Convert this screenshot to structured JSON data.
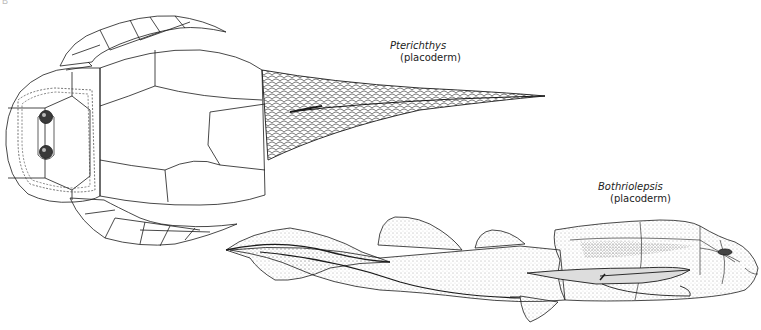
{
  "figure": {
    "corner_mark": "B",
    "specimens": [
      {
        "genus": "Pterichthys",
        "group": "(placoderm)",
        "view": "dorsal"
      },
      {
        "genus": "Bothriolepsis",
        "group": "(placoderm)",
        "view": "lateral"
      }
    ]
  },
  "colors": {
    "ink": "#1a1a1a",
    "background": "#ffffff",
    "stipple": "#555555"
  }
}
